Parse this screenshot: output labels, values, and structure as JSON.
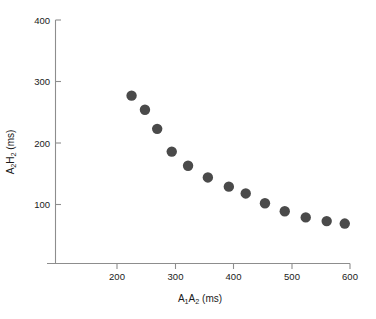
{
  "chart_data": {
    "type": "scatter",
    "title": "",
    "subtitle": "",
    "xlabel": "A1A2 (ms)",
    "xlabel_parts": {
      "a": "A",
      "a_sub": "1",
      "b": "A",
      "b_sub": "2",
      "unit": " (ms)"
    },
    "ylabel": "A2H2 (ms)",
    "ylabel_parts": {
      "a": "A",
      "a_sub": "2",
      "b": "H",
      "b_sub": "2",
      "unit": " (ms)"
    },
    "xlim": [
      110,
      600
    ],
    "ylim": [
      30,
      400
    ],
    "xticks": [
      200,
      300,
      400,
      500,
      600
    ],
    "yticks": [
      100,
      200,
      300,
      400
    ],
    "xtick_labels": [
      "200",
      "300",
      "400",
      "500",
      "600"
    ],
    "ytick_labels": [
      "100",
      "200",
      "300",
      "400"
    ],
    "grid": false,
    "legend": false,
    "marker_color": "#4a4a4a",
    "axis_color": "#8d8d8d",
    "marker_size": 5.2,
    "x": [
      225,
      248,
      269,
      294,
      322,
      356,
      392,
      421,
      454,
      488,
      524,
      560,
      591
    ],
    "y": [
      277,
      254,
      223,
      186,
      163,
      144,
      129,
      118,
      102,
      89,
      79,
      73,
      69
    ],
    "points": [
      {
        "x": 225,
        "y": 277
      },
      {
        "x": 248,
        "y": 254
      },
      {
        "x": 269,
        "y": 223
      },
      {
        "x": 294,
        "y": 186
      },
      {
        "x": 322,
        "y": 163
      },
      {
        "x": 356,
        "y": 144
      },
      {
        "x": 392,
        "y": 129
      },
      {
        "x": 421,
        "y": 118
      },
      {
        "x": 454,
        "y": 102
      },
      {
        "x": 488,
        "y": 89
      },
      {
        "x": 524,
        "y": 79
      },
      {
        "x": 560,
        "y": 73
      },
      {
        "x": 591,
        "y": 69
      }
    ]
  }
}
